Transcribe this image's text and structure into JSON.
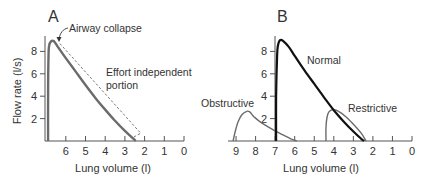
{
  "colors": {
    "text": "#333333",
    "axis": "#555555",
    "curve_gray": "#6b6b6b",
    "curve_normal": "#111111",
    "dashed": "#777777"
  },
  "chart_data": [
    {
      "panel": "A",
      "type": "line",
      "title": "A",
      "xlabel": "Lung volume (l)",
      "ylabel": "Flow rate (l/s)",
      "x_reversed": true,
      "xlim": [
        7.05,
        0
      ],
      "ylim": [
        0,
        9.2
      ],
      "xticks": [
        6,
        5,
        4,
        3,
        2,
        1,
        0
      ],
      "yticks": [
        2,
        4,
        6,
        8
      ],
      "grid": false,
      "series": [
        {
          "name": "Forced expiration",
          "style": "solid-gray-thick",
          "points": [
            [
              6.9,
              0
            ],
            [
              6.9,
              4
            ],
            [
              6.88,
              7.5
            ],
            [
              6.85,
              8.5
            ],
            [
              6.75,
              8.9
            ],
            [
              6.6,
              8.9
            ],
            [
              6.4,
              8.4
            ],
            [
              6.0,
              7.4
            ],
            [
              5.5,
              6.2
            ],
            [
              5.0,
              5.0
            ],
            [
              4.5,
              3.85
            ],
            [
              4.0,
              2.8
            ],
            [
              3.5,
              1.8
            ],
            [
              3.0,
              0.9
            ],
            [
              2.6,
              0.25
            ],
            [
              2.45,
              0
            ]
          ]
        },
        {
          "name": "Effort independent portion (envelope)",
          "style": "dashed",
          "points": [
            [
              6.3,
              8.7
            ],
            [
              2.2,
              0.7
            ],
            [
              2.6,
              0.3
            ]
          ]
        }
      ],
      "annotations": [
        {
          "text": "Airway collapse",
          "arrow_to": [
            6.45,
            8.6
          ]
        },
        {
          "text": "Effort independent portion"
        }
      ]
    },
    {
      "panel": "B",
      "type": "line",
      "title": "B",
      "xlabel": "Lung volume (l)",
      "ylabel": "",
      "x_reversed": true,
      "xlim": [
        9.4,
        0
      ],
      "ylim": [
        0,
        9.2
      ],
      "xticks": [
        9,
        8,
        7,
        6,
        5,
        4,
        3,
        2,
        1,
        0
      ],
      "yticks": [
        2,
        4,
        6,
        8
      ],
      "grid": false,
      "series": [
        {
          "name": "Normal",
          "style": "solid-black-thick",
          "points": [
            [
              6.95,
              0
            ],
            [
              6.95,
              4
            ],
            [
              6.9,
              7.6
            ],
            [
              6.85,
              8.6
            ],
            [
              6.75,
              9.0
            ],
            [
              6.6,
              8.95
            ],
            [
              6.3,
              8.4
            ],
            [
              6.0,
              7.6
            ],
            [
              5.5,
              6.3
            ],
            [
              5.0,
              5.1
            ],
            [
              4.5,
              3.9
            ],
            [
              4.0,
              2.75
            ],
            [
              3.5,
              1.75
            ],
            [
              3.0,
              0.85
            ],
            [
              2.6,
              0.2
            ],
            [
              2.45,
              0
            ]
          ]
        },
        {
          "name": "Obstructive",
          "style": "solid-gray",
          "points": [
            [
              9.15,
              0
            ],
            [
              9.05,
              0.8
            ],
            [
              8.9,
              1.7
            ],
            [
              8.7,
              2.35
            ],
            [
              8.45,
              2.65
            ],
            [
              8.3,
              2.6
            ],
            [
              8.1,
              2.2
            ],
            [
              7.8,
              1.75
            ],
            [
              7.4,
              1.3
            ],
            [
              7.0,
              0.9
            ],
            [
              6.6,
              0.55
            ],
            [
              6.2,
              0.2
            ],
            [
              5.9,
              0
            ]
          ]
        },
        {
          "name": "Restrictive",
          "style": "solid-gray",
          "points": [
            [
              4.4,
              0
            ],
            [
              4.4,
              1.2
            ],
            [
              4.35,
              2.1
            ],
            [
              4.25,
              2.6
            ],
            [
              4.05,
              2.8
            ],
            [
              3.8,
              2.7
            ],
            [
              3.4,
              2.2
            ],
            [
              3.0,
              1.5
            ],
            [
              2.6,
              0.7
            ],
            [
              2.35,
              0
            ]
          ]
        }
      ],
      "annotations": [
        {
          "text": "Normal"
        },
        {
          "text": "Obstructive"
        },
        {
          "text": "Restrictive"
        }
      ]
    }
  ],
  "panelA": {
    "title": "A",
    "ylabel": "Flow rate (l/s)",
    "xlabel": "Lung volume (l)",
    "annot_collapse": "Airway collapse",
    "annot_effort_1": "Effort independent",
    "annot_effort_2": "portion",
    "xticks": [
      "6",
      "5",
      "4",
      "3",
      "2",
      "1",
      "0"
    ],
    "yticks": [
      "2",
      "4",
      "6",
      "8"
    ]
  },
  "panelB": {
    "title": "B",
    "xlabel": "Lung volume (l)",
    "label_normal": "Normal",
    "label_obstructive": "Obstructive",
    "label_restrictive": "Restrictive",
    "xticks": [
      "9",
      "8",
      "7",
      "6",
      "5",
      "4",
      "3",
      "2",
      "1",
      "0"
    ],
    "yticks": [
      "2",
      "4",
      "6",
      "8"
    ]
  }
}
